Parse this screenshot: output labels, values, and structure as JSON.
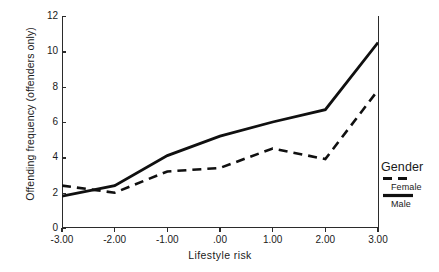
{
  "chart_data": {
    "type": "line",
    "title": "",
    "xlabel": "Lifestyle risk",
    "ylabel": "Offending frequency (offenders only)",
    "x": [
      -3.0,
      -2.0,
      -1.0,
      0.0,
      1.0,
      2.0,
      3.0
    ],
    "xtick_labels": [
      "-3.00",
      "-2.00",
      "-1.00",
      ".00",
      "1.00",
      "2.00",
      "3.00"
    ],
    "ytick_labels": [
      "0",
      "2",
      "4",
      "6",
      "8",
      "10",
      "12"
    ],
    "ytick_values": [
      0,
      2,
      4,
      6,
      8,
      10,
      12
    ],
    "xlim": [
      -3.0,
      3.0
    ],
    "ylim": [
      0,
      12
    ],
    "grid": false,
    "legend_position": "right",
    "series": [
      {
        "name": "Female",
        "style": "dashed",
        "color": "#101010",
        "values": [
          2.4,
          2.0,
          3.2,
          3.4,
          4.5,
          3.9,
          7.8
        ]
      },
      {
        "name": "Male",
        "style": "solid",
        "color": "#101010",
        "values": [
          1.8,
          2.4,
          4.1,
          5.2,
          6.0,
          6.7,
          10.5
        ]
      }
    ]
  },
  "legend": {
    "title": "Gender",
    "entries": [
      {
        "label": "Female",
        "style": "dashed"
      },
      {
        "label": "Male",
        "style": "solid"
      }
    ]
  }
}
